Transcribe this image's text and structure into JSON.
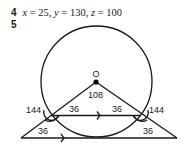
{
  "answers": [
    {
      "number": "4",
      "x_var": "x",
      "x_val": " = 25, ",
      "y_var": "y",
      "y_val": " = 130, ",
      "z_var": "z",
      "z_val": " = 100"
    },
    {
      "number": "5"
    }
  ],
  "diagram": {
    "center_label": "O",
    "angle_center": "108",
    "angle_chord_left": "36",
    "angle_chord_right": "36",
    "angle_ext_left": "144",
    "angle_ext_right": "144",
    "angle_base_left": "36",
    "angle_base_right": "36",
    "line_color": "#1a1a1a",
    "fill_color": "#ffffff"
  }
}
